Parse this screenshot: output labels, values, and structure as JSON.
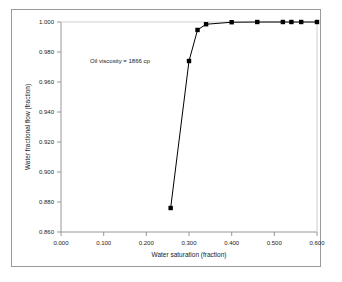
{
  "chart_data": {
    "type": "line",
    "title": "",
    "subtitle": "",
    "xlabel": "Water saturation (fraction)",
    "ylabel": "Water fractional flow (fraction)",
    "xlim": [
      0.0,
      0.6
    ],
    "ylim": [
      0.86,
      1.0
    ],
    "xticks": [
      0.0,
      0.1,
      0.2,
      0.3,
      0.4,
      0.5,
      0.6
    ],
    "xticklabels": [
      "0.000",
      "0.100",
      "0.200",
      "0.300",
      "0.400",
      "0.500",
      "0.600"
    ],
    "yticks": [
      0.86,
      0.88,
      0.9,
      0.92,
      0.94,
      0.96,
      0.98,
      1.0
    ],
    "yticklabels": [
      "0.860",
      "0.880",
      "0.900",
      "0.920",
      "0.940",
      "0.960",
      "0.980",
      "1.000"
    ],
    "grid": false,
    "legend": null,
    "marker": "square",
    "marker_color": "#000000",
    "line_color": "#000000",
    "annotations": [
      {
        "text": "Oil viscosity = 1866 cp",
        "x": 0.135,
        "y": 0.962
      }
    ],
    "series": [
      {
        "name": "Water fractional flow",
        "x": [
          0.257,
          0.3,
          0.32,
          0.34,
          0.4,
          0.46,
          0.52,
          0.54,
          0.563,
          0.6
        ],
        "values": [
          0.876,
          0.974,
          0.9947,
          0.9985,
          0.99985,
          1.0,
          1.0,
          1.0,
          1.0,
          1.0
        ]
      }
    ]
  },
  "figure": {
    "background_color": "#ffffff",
    "frame_color": "#9a9a9a",
    "axis_color": "#8c8c8c",
    "text_color": "#1a1a1a"
  }
}
